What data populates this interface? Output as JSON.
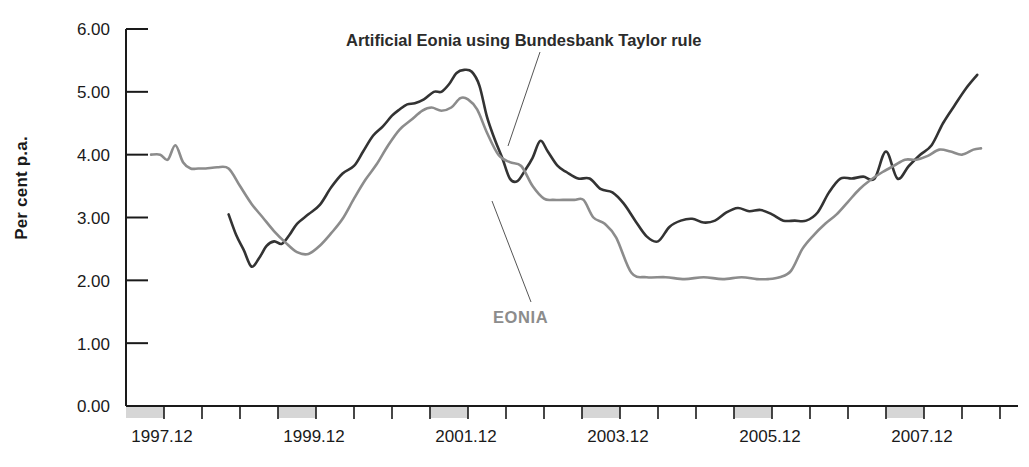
{
  "chart_data": {
    "type": "line",
    "title": "",
    "xlabel": "",
    "ylabel": "Per cent p.a.",
    "ylim": [
      0.0,
      6.0
    ],
    "xlim": [
      1997.5,
      2009.0
    ],
    "grid": false,
    "legend_position": "inline-annotations",
    "y_ticks": [
      "0.00",
      "1.00",
      "2.00",
      "3.00",
      "4.00",
      "5.00",
      "6.00"
    ],
    "y_tick_values": [
      0.0,
      1.0,
      2.0,
      3.0,
      4.0,
      5.0,
      6.0
    ],
    "x_ticks": [
      "1997.12",
      "1999.12",
      "2001.12",
      "2003.12",
      "2005.12",
      "2007.12"
    ],
    "x_tick_values": [
      1998.0,
      2000.0,
      2002.0,
      2004.0,
      2006.0,
      2008.0
    ],
    "x_minor_interval": 0.5,
    "annotations": [
      {
        "name": "artificial-eonia-label",
        "text": "Artificial Eonia using Bundesbank Taylor rule",
        "color": "#2b2b2b",
        "leader_from": [
          540,
          52
        ],
        "leader_to": [
          508,
          146
        ]
      },
      {
        "name": "eonia-label",
        "text": "EONIA",
        "color": "#8c8c8c",
        "leader_from": [
          531,
          302
        ],
        "leader_to": [
          492,
          201
        ]
      }
    ],
    "series": [
      {
        "name": "Artificial Eonia using Bundesbank Taylor rule",
        "color": "#333333",
        "linewidth": 2.6,
        "x": [
          1998.85,
          1998.95,
          1999.05,
          1999.15,
          1999.25,
          1999.35,
          1999.45,
          1999.55,
          1999.65,
          1999.75,
          1999.9,
          2000.05,
          2000.2,
          2000.35,
          2000.5,
          2000.62,
          2000.75,
          2000.88,
          2001.0,
          2001.1,
          2001.2,
          2001.3,
          2001.42,
          2001.55,
          2001.65,
          2001.75,
          2001.85,
          2001.95,
          2002.05,
          2002.15,
          2002.25,
          2002.35,
          2002.45,
          2002.55,
          2002.65,
          2002.75,
          2002.85,
          2002.95,
          2003.05,
          2003.18,
          2003.3,
          2003.45,
          2003.6,
          2003.75,
          2003.9,
          2004.05,
          2004.2,
          2004.35,
          2004.5,
          2004.65,
          2004.8,
          2004.95,
          2005.1,
          2005.25,
          2005.4,
          2005.55,
          2005.7,
          2005.85,
          2006.0,
          2006.15,
          2006.3,
          2006.45,
          2006.6,
          2006.75,
          2006.9,
          2007.05,
          2007.2,
          2007.35,
          2007.5,
          2007.65,
          2007.8,
          2007.95,
          2008.1,
          2008.25,
          2008.4,
          2008.55,
          2008.7
        ],
        "y": [
          3.05,
          2.72,
          2.48,
          2.22,
          2.35,
          2.55,
          2.62,
          2.58,
          2.72,
          2.9,
          3.05,
          3.2,
          3.48,
          3.7,
          3.82,
          4.05,
          4.3,
          4.45,
          4.62,
          4.72,
          4.8,
          4.82,
          4.88,
          5.0,
          5.0,
          5.12,
          5.3,
          5.35,
          5.32,
          5.1,
          4.6,
          4.25,
          3.95,
          3.62,
          3.58,
          3.75,
          3.95,
          4.22,
          4.05,
          3.82,
          3.72,
          3.62,
          3.62,
          3.45,
          3.4,
          3.22,
          2.95,
          2.7,
          2.62,
          2.85,
          2.95,
          2.98,
          2.92,
          2.95,
          3.08,
          3.15,
          3.1,
          3.12,
          3.05,
          2.95,
          2.95,
          2.95,
          3.08,
          3.4,
          3.62,
          3.62,
          3.65,
          3.62,
          4.05,
          3.62,
          3.82,
          4.0,
          4.15,
          4.5,
          4.78,
          5.05,
          5.27
        ]
      },
      {
        "name": "EONIA",
        "color": "#8c8c8c",
        "linewidth": 2.6,
        "x": [
          1997.83,
          1997.95,
          1998.05,
          1998.15,
          1998.25,
          1998.35,
          1998.45,
          1998.55,
          1998.7,
          1998.85,
          1999.0,
          1999.15,
          1999.3,
          1999.45,
          1999.6,
          1999.75,
          1999.9,
          2000.05,
          2000.2,
          2000.35,
          2000.5,
          2000.65,
          2000.8,
          2000.95,
          2001.1,
          2001.25,
          2001.4,
          2001.52,
          2001.65,
          2001.78,
          2001.9,
          2002.0,
          2002.12,
          2002.25,
          2002.4,
          2002.55,
          2002.7,
          2002.85,
          2003.0,
          2003.12,
          2003.25,
          2003.4,
          2003.52,
          2003.65,
          2003.8,
          2003.95,
          2004.15,
          2004.35,
          2004.6,
          2004.85,
          2005.1,
          2005.35,
          2005.6,
          2005.8,
          2005.95,
          2006.1,
          2006.25,
          2006.4,
          2006.55,
          2006.7,
          2006.85,
          2007.0,
          2007.15,
          2007.3,
          2007.45,
          2007.6,
          2007.75,
          2007.9,
          2008.05,
          2008.2,
          2008.35,
          2008.5,
          2008.65,
          2008.75
        ],
        "y": [
          4.0,
          4.0,
          3.92,
          4.15,
          3.88,
          3.78,
          3.78,
          3.78,
          3.8,
          3.78,
          3.5,
          3.22,
          3.0,
          2.78,
          2.6,
          2.45,
          2.42,
          2.55,
          2.75,
          2.98,
          3.3,
          3.6,
          3.85,
          4.15,
          4.4,
          4.55,
          4.7,
          4.75,
          4.7,
          4.75,
          4.9,
          4.88,
          4.72,
          4.35,
          4.0,
          3.88,
          3.82,
          3.5,
          3.3,
          3.28,
          3.28,
          3.28,
          3.28,
          3.0,
          2.9,
          2.68,
          2.12,
          2.05,
          2.05,
          2.02,
          2.05,
          2.02,
          2.05,
          2.02,
          2.02,
          2.05,
          2.15,
          2.5,
          2.72,
          2.9,
          3.05,
          3.25,
          3.45,
          3.6,
          3.72,
          3.82,
          3.92,
          3.92,
          3.98,
          4.08,
          4.05,
          4.0,
          4.08,
          4.1
        ]
      }
    ]
  },
  "axis": {
    "ylabel": "Per cent p.a.",
    "y_tick_labels": [
      "6.00",
      "5.00",
      "4.00",
      "3.00",
      "2.00",
      "1.00",
      "0.00"
    ],
    "x_tick_labels": [
      "1997.12",
      "1999.12",
      "2001.12",
      "2003.12",
      "2005.12",
      "2007.12"
    ]
  },
  "annotations": {
    "taylor_rule": "Artificial Eonia using Bundesbank Taylor rule",
    "eonia": "EONIA"
  },
  "colors": {
    "dark_series": "#333333",
    "gray_series": "#8c8c8c",
    "axis": "#1a1a1a",
    "band": "#d6d6d6",
    "background": "#ffffff"
  }
}
